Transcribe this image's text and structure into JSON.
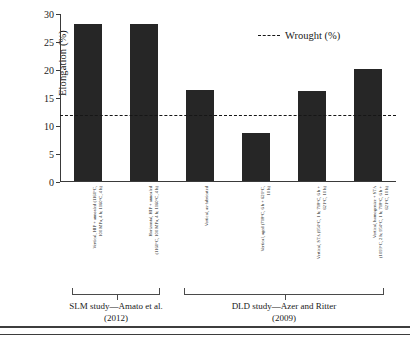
{
  "chart_data": {
    "type": "bar",
    "title": "",
    "xlabel": "",
    "ylabel": "Elongation (%)",
    "ylim": [
      0,
      30
    ],
    "yticks": [
      0,
      5,
      10,
      15,
      20,
      25,
      30
    ],
    "grid": false,
    "legend_position": "top-right",
    "categories": [
      "Vertical, HIP + annealed (1160°C,\n100 MPa, 4 h; 1160°C, 4 h)",
      "Horizontal, HIP + annealed\n(1160°C, 100 MPa, 4 h; 1160°C, 4 h)",
      "Vertical, as-fabricated",
      "Vertical, aged (718°C, 6 h + 621°C,\n10 h)",
      "Vertical, STA (954°C, 1 h; 718°C, 6 h +\n621°C, 10 h)",
      "Vertical, homogenize + STA\n(1093°C, 2 h; 954°C, 1 h; 718°C, 6 h +\n621°C, 10 h)"
    ],
    "values": [
      28,
      28,
      16.2,
      8.5,
      16,
      20
    ],
    "series": [
      {
        "name": "Elongation (%)",
        "values": [
          28,
          28,
          16.2,
          8.5,
          16,
          20
        ]
      }
    ],
    "reference_line": {
      "label": "Wrought (%)",
      "value": 12,
      "style": "dashed"
    },
    "groups": [
      {
        "label": "SLM study—Amato et al.\n(2012)",
        "bars": [
          0,
          1
        ]
      },
      {
        "label": "DLD study—Azer and Ritter\n(2009)",
        "bars": [
          2,
          3,
          4,
          5
        ]
      }
    ],
    "bar_color": "#262626"
  },
  "legend": {
    "entries": [
      {
        "label": "Wrought (%)",
        "marker": "dashed-line"
      }
    ]
  },
  "axis": {
    "y_label": "Elongation (%)",
    "y_ticks": [
      "0",
      "5",
      "10",
      "15",
      "20",
      "25",
      "30"
    ]
  },
  "groups": {
    "left": "SLM study—Amato et al.\n(2012)",
    "right": "DLD study—Azer and Ritter\n(2009)"
  }
}
